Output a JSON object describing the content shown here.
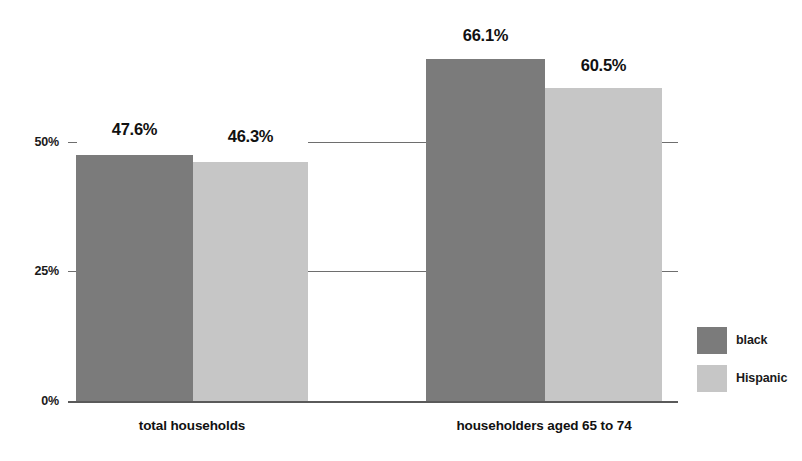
{
  "chart_data": {
    "type": "bar",
    "title": "",
    "xlabel": "",
    "ylabel": "",
    "categories": [
      "total households",
      "householders aged 65 to 74"
    ],
    "series": [
      {
        "name": "black",
        "color": "#7b7b7b",
        "values": [
          47.6,
          66.1
        ],
        "labels": [
          "47.6%",
          "60.5%"
        ]
      },
      {
        "name": "Hispanic",
        "color": "#c6c6c6",
        "values": [
          46.3,
          60.5
        ],
        "labels": [
          "46.3%",
          "60.5%"
        ]
      }
    ],
    "value_labels": {
      "g1_black": "47.6%",
      "g1_hispanic": "46.3%",
      "g2_black": "66.1%",
      "g2_hispanic": "60.5%"
    },
    "ylim": [
      0,
      75
    ],
    "yticks": [
      0,
      25,
      50
    ],
    "ytick_labels": [
      "0%",
      "25%",
      "50%"
    ],
    "grid": true,
    "legend_position": "right"
  },
  "axis": {
    "y_ticks": [
      {
        "label": "50%",
        "value": 50
      },
      {
        "label": "25%",
        "value": 25
      },
      {
        "label": "0%",
        "value": 0
      }
    ]
  },
  "legend": {
    "items": [
      {
        "label": "black",
        "color": "#7b7b7b"
      },
      {
        "label": "Hispanic",
        "color": "#c6c6c6"
      }
    ]
  }
}
